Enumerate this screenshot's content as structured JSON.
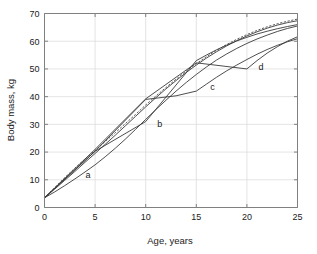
{
  "chart_data": {
    "type": "line",
    "title": "",
    "xlabel": "Age, years",
    "ylabel": "Body mass, kg",
    "xlim": [
      0,
      25
    ],
    "ylim": [
      0,
      70
    ],
    "xticks": [
      0,
      5,
      10,
      15,
      20,
      25
    ],
    "yticks": [
      0,
      10,
      20,
      30,
      40,
      50,
      60,
      70
    ],
    "xtick_labels": [
      "0",
      "5",
      "10",
      "15",
      "20",
      "25"
    ],
    "ytick_labels": [
      "0",
      "10",
      "20",
      "30",
      "40",
      "50",
      "60",
      "70"
    ],
    "grid": true,
    "legend": "inline-curve-labels",
    "annotations": [
      {
        "text": "a",
        "x": 4.3,
        "y": 10.5
      },
      {
        "text": "b",
        "x": 11.4,
        "y": 29.0
      },
      {
        "text": "c",
        "x": 16.6,
        "y": 42.5
      },
      {
        "text": "d",
        "x": 21.4,
        "y": 49.5
      }
    ],
    "series": [
      {
        "name": "reference",
        "style": "dotted",
        "label": "",
        "x": [
          0,
          1,
          2,
          3,
          4,
          5,
          6,
          7,
          8,
          9,
          10,
          11,
          12,
          13,
          14,
          15,
          16,
          17,
          18,
          19,
          20,
          21,
          22,
          23,
          24,
          25
        ],
        "values": [
          3.5,
          7.2,
          10.8,
          14.2,
          17.5,
          20.6,
          23.8,
          27.0,
          30.3,
          33.6,
          37.0,
          40.2,
          43.3,
          46.3,
          49.2,
          51.9,
          54.4,
          56.7,
          58.8,
          60.7,
          62.4,
          63.9,
          65.2,
          66.3,
          67.2,
          68.0
        ]
      },
      {
        "name": "a",
        "style": "solid",
        "label": "a",
        "x": [
          0,
          1,
          2,
          3,
          4,
          5,
          6,
          7,
          8,
          9,
          10,
          11,
          12,
          13,
          14,
          15,
          16,
          17,
          18,
          19,
          20,
          21,
          22,
          23,
          24,
          25
        ],
        "values": [
          3.5,
          5.6,
          7.9,
          10.3,
          12.8,
          15.4,
          18.3,
          21.4,
          24.7,
          28.2,
          31.8,
          35.3,
          38.7,
          42.0,
          45.1,
          48.0,
          50.7,
          53.2,
          55.4,
          57.4,
          59.2,
          60.8,
          62.2,
          63.5,
          64.6,
          65.5
        ]
      },
      {
        "name": "a-upper",
        "style": "solid",
        "label": "",
        "x": [
          0,
          1,
          2,
          3,
          4,
          5,
          6,
          7,
          8,
          9,
          10,
          11,
          12,
          13,
          14,
          15,
          16,
          17,
          18,
          19,
          20,
          21,
          22,
          23,
          24,
          25
        ],
        "values": [
          3.5,
          6.6,
          9.8,
          13.0,
          16.3,
          19.5,
          22.8,
          26.1,
          29.5,
          32.9,
          36.3,
          39.6,
          42.8,
          45.8,
          48.7,
          51.4,
          53.9,
          56.2,
          58.3,
          60.2,
          61.9,
          63.4,
          64.7,
          65.8,
          66.7,
          67.4
        ]
      },
      {
        "name": "b",
        "style": "piecewise",
        "label": "b",
        "x": [
          0,
          5,
          10,
          15,
          16,
          17,
          18,
          19,
          20,
          21,
          22,
          23,
          24,
          25
        ],
        "values": [
          3.5,
          20.3,
          31.0,
          53.0,
          55.0,
          56.9,
          58.6,
          60.1,
          61.4,
          62.6,
          63.6,
          64.5,
          65.3,
          66.0
        ]
      },
      {
        "name": "c",
        "style": "piecewise",
        "label": "c",
        "x": [
          0,
          5,
          10,
          13,
          15,
          16,
          17,
          18,
          19,
          20,
          21,
          22,
          23,
          24,
          25
        ],
        "values": [
          3.5,
          20.3,
          39.0,
          40.3,
          42.0,
          44.5,
          47.0,
          49.3,
          51.4,
          53.4,
          55.3,
          57.0,
          58.5,
          59.8,
          60.9
        ]
      },
      {
        "name": "d",
        "style": "piecewise",
        "label": "d",
        "x": [
          0,
          5,
          10,
          15,
          20,
          21,
          22,
          23,
          24,
          25
        ],
        "values": [
          3.5,
          21.0,
          39.2,
          52.2,
          50.0,
          53.0,
          55.7,
          58.0,
          60.0,
          61.6
        ]
      }
    ]
  }
}
